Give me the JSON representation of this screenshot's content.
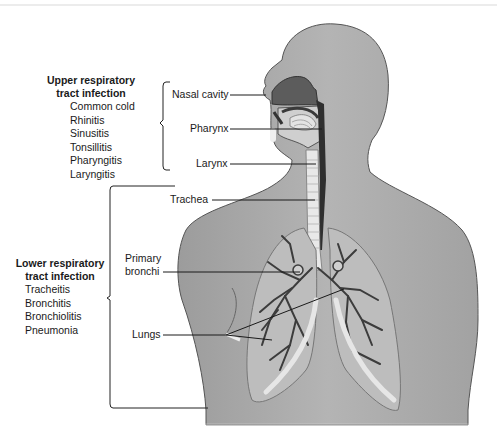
{
  "diagram": {
    "upper_group": {
      "title_line1": "Upper respiratory",
      "title_line2": "tract infection",
      "items": [
        "Common cold",
        "Rhinitis",
        "Sinusitis",
        "Tonsillitis",
        "Pharyngitis",
        "Laryngitis"
      ]
    },
    "lower_group": {
      "title_line1": "Lower respiratory",
      "title_line2": "tract infection",
      "items": [
        "Tracheitis",
        "Bronchitis",
        "Bronchiolitis",
        "Pneumonia"
      ]
    },
    "labels": {
      "nasal_cavity": "Nasal cavity",
      "pharynx": "Pharynx",
      "larynx": "Larynx",
      "trachea": "Trachea",
      "primary_bronchi_line1": "Primary",
      "primary_bronchi_line2": "bronchi",
      "lungs": "Lungs"
    }
  }
}
